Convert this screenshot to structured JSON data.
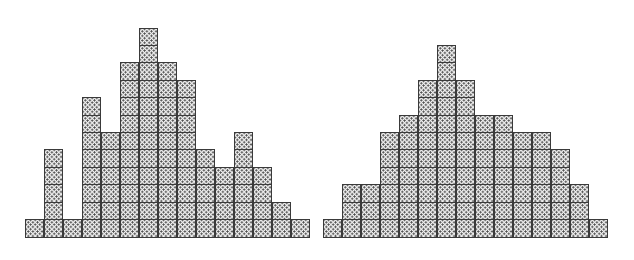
{
  "figure": {
    "title": "",
    "background_color": "#ffffff",
    "cell_fill_color": "#efefef",
    "cell_border_color": "#3a3a3a",
    "cell_stipple_color": "#4a4a4a",
    "cell_size_px": 19
  },
  "chart_data": [
    {
      "type": "bar",
      "name": "left-histogram",
      "title": "",
      "xlabel": "",
      "ylabel": "",
      "grid": false,
      "legend": "none",
      "axis_visible": false,
      "categories": [
        "1",
        "2",
        "3",
        "4",
        "5",
        "6",
        "7",
        "8",
        "9",
        "10",
        "11",
        "12",
        "13",
        "14",
        "15"
      ],
      "values": [
        1,
        5,
        1,
        8,
        6,
        10,
        12,
        10,
        9,
        5,
        4,
        6,
        4,
        2,
        1
      ],
      "ylim": [
        0,
        12
      ],
      "unit": "blocks",
      "note": "irregular multi-modal block histogram"
    },
    {
      "type": "bar",
      "name": "right-histogram",
      "title": "",
      "xlabel": "",
      "ylabel": "",
      "grid": false,
      "legend": "none",
      "axis_visible": false,
      "categories": [
        "1",
        "2",
        "3",
        "4",
        "5",
        "6",
        "7",
        "8",
        "9",
        "10",
        "11",
        "12",
        "13",
        "14",
        "15"
      ],
      "values": [
        1,
        3,
        3,
        6,
        7,
        9,
        11,
        9,
        7,
        7,
        6,
        6,
        5,
        3,
        1
      ],
      "ylim": [
        0,
        11
      ],
      "unit": "blocks",
      "note": "smooth unimodal bell-shaped block histogram"
    }
  ]
}
